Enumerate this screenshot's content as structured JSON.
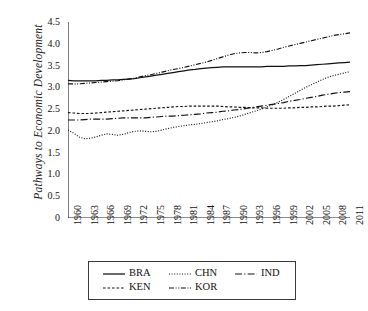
{
  "chart_data": {
    "type": "line",
    "title": "",
    "xlabel": "",
    "ylabel": "Pathways to Economic Development",
    "xlim": [
      1960,
      2011
    ],
    "ylim": [
      0,
      4.5
    ],
    "grid": false,
    "legend_position": "bottom",
    "ytick_labels": [
      "0",
      "0.5",
      "1.0",
      "1.5",
      "2.0",
      "2.5",
      "3.0",
      "3.5",
      "4.0",
      "4.5"
    ],
    "ytick_values": [
      0,
      0.5,
      1.0,
      1.5,
      2.0,
      2.5,
      3.0,
      3.5,
      4.0,
      4.5
    ],
    "xtick_labels": [
      "1960",
      "1963",
      "1966",
      "1969",
      "1972",
      "1975",
      "1978",
      "1981",
      "1984",
      "1987",
      "1990",
      "1993",
      "1996",
      "1999",
      "2002",
      "2005",
      "2008",
      "2011"
    ],
    "xtick_values": [
      1960,
      1963,
      1966,
      1969,
      1972,
      1975,
      1978,
      1981,
      1984,
      1987,
      1990,
      1993,
      1996,
      1999,
      2002,
      2005,
      2008,
      2011
    ],
    "minor_ticks_every": 1,
    "x": [
      1960,
      1961,
      1962,
      1963,
      1964,
      1965,
      1966,
      1967,
      1968,
      1969,
      1970,
      1971,
      1972,
      1973,
      1974,
      1975,
      1976,
      1977,
      1978,
      1979,
      1980,
      1981,
      1982,
      1983,
      1984,
      1985,
      1986,
      1987,
      1988,
      1989,
      1990,
      1991,
      1992,
      1993,
      1994,
      1995,
      1996,
      1997,
      1998,
      1999,
      2000,
      2001,
      2002,
      2003,
      2004,
      2005,
      2006,
      2007,
      2008,
      2009,
      2010,
      2011
    ],
    "series": [
      {
        "name": "BRA",
        "dash": "solid",
        "values": [
          3.16,
          3.15,
          3.15,
          3.15,
          3.15,
          3.15,
          3.16,
          3.16,
          3.17,
          3.17,
          3.18,
          3.19,
          3.2,
          3.22,
          3.24,
          3.26,
          3.28,
          3.3,
          3.32,
          3.34,
          3.36,
          3.38,
          3.4,
          3.41,
          3.43,
          3.44,
          3.45,
          3.46,
          3.47,
          3.47,
          3.47,
          3.47,
          3.47,
          3.47,
          3.47,
          3.47,
          3.48,
          3.48,
          3.48,
          3.48,
          3.49,
          3.49,
          3.5,
          3.5,
          3.51,
          3.52,
          3.53,
          3.54,
          3.55,
          3.56,
          3.57,
          3.58
        ]
      },
      {
        "name": "CHN",
        "dash": "dotted",
        "values": [
          2.02,
          1.95,
          1.86,
          1.82,
          1.83,
          1.86,
          1.9,
          1.93,
          1.92,
          1.9,
          1.92,
          1.96,
          1.99,
          2.0,
          1.99,
          1.98,
          1.99,
          2.02,
          2.05,
          2.08,
          2.1,
          2.12,
          2.14,
          2.15,
          2.17,
          2.19,
          2.21,
          2.23,
          2.26,
          2.28,
          2.31,
          2.34,
          2.38,
          2.42,
          2.46,
          2.5,
          2.55,
          2.6,
          2.66,
          2.72,
          2.79,
          2.86,
          2.93,
          3.0,
          3.06,
          3.12,
          3.18,
          3.23,
          3.27,
          3.3,
          3.33,
          3.36
        ]
      },
      {
        "name": "IND",
        "dash": "longdashdot",
        "values": [
          2.25,
          2.25,
          2.25,
          2.26,
          2.27,
          2.27,
          2.27,
          2.27,
          2.28,
          2.29,
          2.3,
          2.3,
          2.3,
          2.3,
          2.3,
          2.31,
          2.32,
          2.33,
          2.34,
          2.34,
          2.35,
          2.36,
          2.37,
          2.38,
          2.39,
          2.41,
          2.42,
          2.43,
          2.45,
          2.46,
          2.48,
          2.49,
          2.51,
          2.53,
          2.55,
          2.57,
          2.59,
          2.61,
          2.63,
          2.65,
          2.68,
          2.7,
          2.72,
          2.75,
          2.77,
          2.79,
          2.82,
          2.84,
          2.86,
          2.88,
          2.89,
          2.9
        ]
      },
      {
        "name": "KEN",
        "dash": "dashed",
        "values": [
          2.42,
          2.41,
          2.4,
          2.4,
          2.4,
          2.41,
          2.42,
          2.43,
          2.44,
          2.45,
          2.46,
          2.47,
          2.48,
          2.49,
          2.5,
          2.51,
          2.52,
          2.53,
          2.54,
          2.55,
          2.56,
          2.56,
          2.57,
          2.57,
          2.57,
          2.57,
          2.57,
          2.57,
          2.56,
          2.55,
          2.55,
          2.54,
          2.54,
          2.53,
          2.53,
          2.53,
          2.52,
          2.52,
          2.52,
          2.52,
          2.53,
          2.53,
          2.54,
          2.54,
          2.55,
          2.55,
          2.56,
          2.57,
          2.57,
          2.58,
          2.59,
          2.6
        ]
      },
      {
        "name": "KOR",
        "dash": "dashdotdot",
        "values": [
          3.08,
          3.08,
          3.08,
          3.09,
          3.1,
          3.11,
          3.12,
          3.13,
          3.14,
          3.15,
          3.17,
          3.19,
          3.21,
          3.24,
          3.27,
          3.29,
          3.32,
          3.35,
          3.38,
          3.41,
          3.43,
          3.46,
          3.49,
          3.52,
          3.55,
          3.58,
          3.62,
          3.66,
          3.7,
          3.74,
          3.77,
          3.79,
          3.8,
          3.8,
          3.79,
          3.8,
          3.82,
          3.85,
          3.88,
          3.92,
          3.95,
          3.98,
          4.01,
          4.04,
          4.07,
          4.1,
          4.13,
          4.16,
          4.19,
          4.21,
          4.23,
          4.25
        ]
      }
    ],
    "legend": [
      {
        "label": "BRA",
        "dash": "solid"
      },
      {
        "label": "CHN",
        "dash": "dotted"
      },
      {
        "label": "IND",
        "dash": "longdashdot"
      },
      {
        "label": "KEN",
        "dash": "dashed"
      },
      {
        "label": "KOR",
        "dash": "dashdotdot"
      }
    ]
  }
}
